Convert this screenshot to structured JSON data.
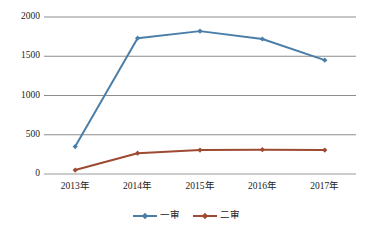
{
  "chart_data": {
    "type": "line",
    "title": "",
    "xlabel": "",
    "ylabel": "",
    "categories": [
      "2013年",
      "2014年",
      "2015年",
      "2016年",
      "2017年"
    ],
    "ylim": [
      0,
      2000
    ],
    "yticks": [
      0,
      500,
      1000,
      1500,
      2000
    ],
    "ytick_labels": [
      "0",
      "500",
      "1000",
      "1500",
      "2000"
    ],
    "grid": true,
    "legend_position": "bottom",
    "series": [
      {
        "name": "一审",
        "color": "#4A7EA8",
        "marker": "diamond",
        "values": [
          350,
          1730,
          1820,
          1720,
          1450
        ]
      },
      {
        "name": "二审",
        "color": "#9E4A32",
        "marker": "diamond",
        "values": [
          50,
          265,
          305,
          310,
          305
        ]
      }
    ]
  },
  "axis": {
    "gridline_color": "#808080",
    "baseline_color": "#9a9a9a"
  },
  "legend": {
    "items": [
      {
        "label": "一审",
        "color": "#4A7EA8"
      },
      {
        "label": "二审",
        "color": "#9E4A32"
      }
    ]
  }
}
